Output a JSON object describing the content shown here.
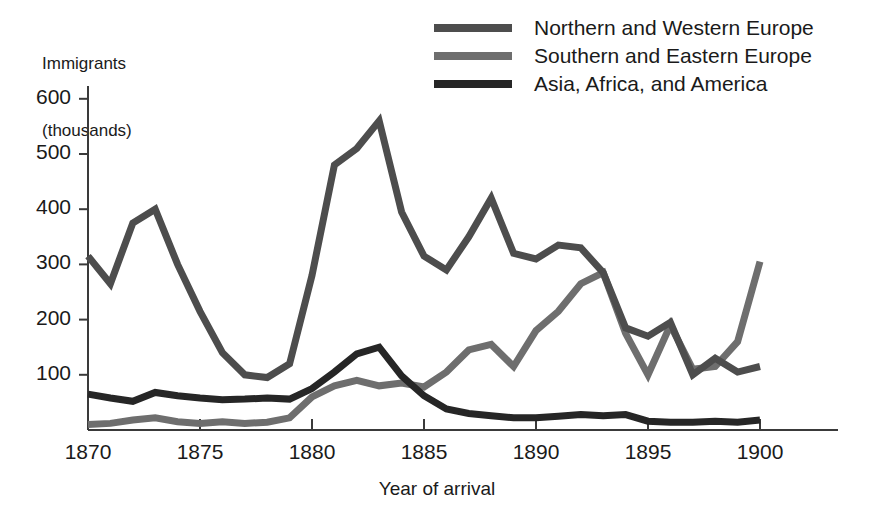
{
  "chart_data": {
    "type": "line",
    "title": "",
    "ylabel": "Immigrants\n(thousands)",
    "ylabel_lines": [
      "Immigrants",
      "(thousands)"
    ],
    "xlabel": "Year of arrival",
    "xlim": [
      1870,
      1900
    ],
    "ylim": [
      0,
      640
    ],
    "yticks": [
      100,
      200,
      300,
      400,
      500,
      600
    ],
    "ytick_labels": [
      "100",
      "200",
      "300",
      "400",
      "500",
      "600"
    ],
    "xticks": [
      1870,
      1875,
      1880,
      1885,
      1890,
      1895,
      1900
    ],
    "xtick_labels": [
      "1870",
      "1875",
      "1880",
      "1885",
      "1890",
      "1895",
      "1900"
    ],
    "grid": false,
    "legend_position": "top-right",
    "x": [
      1870,
      1871,
      1872,
      1873,
      1874,
      1875,
      1876,
      1877,
      1878,
      1879,
      1880,
      1881,
      1882,
      1883,
      1884,
      1885,
      1886,
      1887,
      1888,
      1889,
      1890,
      1891,
      1892,
      1893,
      1894,
      1895,
      1896,
      1897,
      1898,
      1899,
      1900
    ],
    "series": [
      {
        "name": "Northern and Western Europe",
        "color": "#4d4d4d",
        "values": [
          315,
          265,
          375,
          400,
          300,
          215,
          140,
          100,
          95,
          120,
          280,
          480,
          510,
          560,
          395,
          315,
          290,
          350,
          420,
          320,
          310,
          335,
          330,
          285,
          185,
          170,
          195,
          100,
          130,
          105,
          115
        ]
      },
      {
        "name": "Southern and Eastern Europe",
        "color": "#6e6e6e",
        "values": [
          10,
          12,
          18,
          22,
          15,
          12,
          15,
          12,
          14,
          22,
          60,
          80,
          90,
          80,
          85,
          78,
          105,
          145,
          155,
          115,
          180,
          215,
          265,
          285,
          175,
          100,
          190,
          110,
          115,
          160,
          305
        ]
      },
      {
        "name": "Asia, Africa, and America",
        "color": "#262626",
        "values": [
          65,
          58,
          52,
          68,
          62,
          58,
          55,
          56,
          58,
          56,
          75,
          105,
          138,
          150,
          98,
          62,
          38,
          30,
          26,
          22,
          22,
          25,
          28,
          26,
          28,
          16,
          14,
          14,
          16,
          14,
          18
        ]
      }
    ]
  },
  "legend": {
    "items": [
      {
        "label": "Northern and Western Europe",
        "color": "#4d4d4d"
      },
      {
        "label": "Southern and Eastern Europe",
        "color": "#6e6e6e"
      },
      {
        "label": "Asia, Africa, and America",
        "color": "#262626"
      }
    ]
  },
  "axes": {
    "y_title_line1": "Immigrants",
    "y_title_line2": "(thousands)",
    "x_title": "Year of arrival"
  }
}
